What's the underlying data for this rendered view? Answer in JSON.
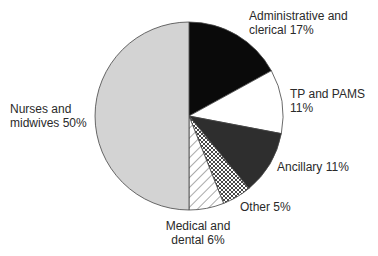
{
  "chart_data": {
    "type": "pie",
    "title": "",
    "center": [
      189,
      116
    ],
    "radius": 94,
    "start_angle_deg": 0,
    "direction": "clockwise",
    "slices": [
      {
        "name": "Administrative and clerical",
        "value": 17,
        "label_lines": [
          "Administrative and",
          "clerical 17%"
        ],
        "fill": "#0a0a0a",
        "pattern": "solid"
      },
      {
        "name": "TP and PAMS",
        "value": 11,
        "label_lines": [
          "TP and PAMS",
          "11%"
        ],
        "fill": "#ffffff",
        "pattern": "solid"
      },
      {
        "name": "Ancillary",
        "value": 11,
        "label_lines": [
          "Ancillary 11%"
        ],
        "fill": "#2e2e2e",
        "pattern": "solid"
      },
      {
        "name": "Other",
        "value": 5,
        "label_lines": [
          "Other 5%"
        ],
        "fill": "#ffffff",
        "pattern": "crosshatch"
      },
      {
        "name": "Medical and dental",
        "value": 6,
        "label_lines": [
          "Medical and",
          "dental 6%"
        ],
        "fill": "#ffffff",
        "pattern": "diagonal"
      },
      {
        "name": "Nurses and midwives",
        "value": 50,
        "label_lines": [
          "Nurses and",
          "midwives 50%"
        ],
        "fill": "#d3d3d3",
        "pattern": "solid"
      }
    ],
    "labels": [
      {
        "slice": 0,
        "x": 249,
        "y": 9,
        "align": "left"
      },
      {
        "slice": 1,
        "x": 290,
        "y": 87,
        "align": "left"
      },
      {
        "slice": 2,
        "x": 277,
        "y": 160,
        "align": "left"
      },
      {
        "slice": 3,
        "x": 240,
        "y": 200,
        "align": "left"
      },
      {
        "slice": 4,
        "x": 198,
        "y": 219,
        "align": "center"
      },
      {
        "slice": 5,
        "x": 10,
        "y": 102,
        "align": "left"
      }
    ],
    "legend": "none",
    "grid": false
  }
}
